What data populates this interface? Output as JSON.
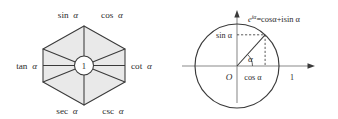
{
  "figure": {
    "background_color": "#ffffff",
    "stroke_color": "#3a3a3a",
    "fill_color": "#e8e8e8",
    "text_color": "#2b2b2b"
  },
  "hexagon_diagram": {
    "name": "trigonometric-identity-hexagon",
    "center_label": "1",
    "vertices": [
      {
        "position": "top-left",
        "label_prefix": "sin",
        "label_arg": "α",
        "label": "sin α"
      },
      {
        "position": "top-right",
        "label_prefix": "cos",
        "label_arg": "α",
        "label": "cos α"
      },
      {
        "position": "right",
        "label_prefix": "cot",
        "label_arg": "α",
        "label": "cot α"
      },
      {
        "position": "bottom-right",
        "label_prefix": "csc",
        "label_arg": "α",
        "label": "csc α"
      },
      {
        "position": "bottom-left",
        "label_prefix": "sec",
        "label_arg": "α",
        "label": "sec α"
      },
      {
        "position": "left",
        "label_prefix": "tan",
        "label_arg": "α",
        "label": "tan α"
      }
    ]
  },
  "circle_diagram": {
    "name": "unit-circle-euler-diagram",
    "origin_label": "O",
    "angle_label": "α",
    "vertical_projection_label": "sin α",
    "horizontal_projection_label": "cos α",
    "x_axis_tick_label": "1",
    "euler_formula": {
      "base": "e",
      "exponent": "iα",
      "body": "=cosα+isin α",
      "full": "e^{iα}=cosα+isin α"
    }
  }
}
